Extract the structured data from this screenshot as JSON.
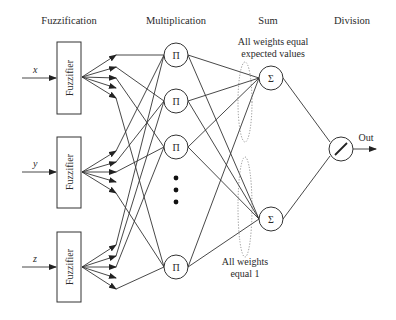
{
  "headers": {
    "fuzzification": "Fuzzification",
    "multiplication": "Multiplication",
    "sum": "Sum",
    "division": "Division"
  },
  "inputs": [
    {
      "label": "x"
    },
    {
      "label": "y"
    },
    {
      "label": "z"
    }
  ],
  "fuzzifier_label": "Fuzzifier",
  "product_symbol": "Π",
  "sum_symbol": "Σ",
  "output_label": "Out",
  "annotations": {
    "top_line1": "All weights equal",
    "top_line2": "expected values",
    "bottom_line1": "All weights",
    "bottom_line2": "equal 1"
  },
  "colors": {
    "line": "#333333",
    "text": "#2a2a2a",
    "dotted": "#777777",
    "background": "#ffffff"
  }
}
